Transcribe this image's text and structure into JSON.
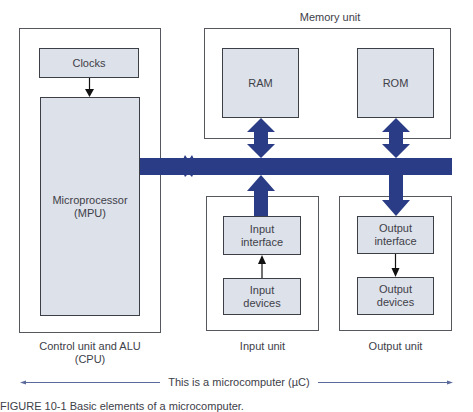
{
  "diagram": {
    "title_memory": "Memory unit",
    "cpu": {
      "label_line1": "Control unit and ALU",
      "label_line2": "(CPU)",
      "clocks": "Clocks",
      "mpu_line1": "Microprocessor",
      "mpu_line2": "(MPU)"
    },
    "memory": {
      "ram": "RAM",
      "rom": "ROM"
    },
    "input": {
      "unit_label": "Input unit",
      "interface_line1": "Input",
      "interface_line2": "interface",
      "devices_line1": "Input",
      "devices_line2": "devices"
    },
    "output": {
      "unit_label": "Output unit",
      "interface_line1": "Output",
      "interface_line2": "interface",
      "devices_line1": "Output",
      "devices_line2": "devices"
    },
    "span_label": "This is a microcomputer (µC)",
    "figure_caption": "FIGURE 10-1   Basic elements of a microcomputer.",
    "colors": {
      "bus": "#2a3c85",
      "box_fill": "#dde1ea",
      "box_border": "#3c3f46",
      "span_line": "#5a6a9a"
    }
  }
}
